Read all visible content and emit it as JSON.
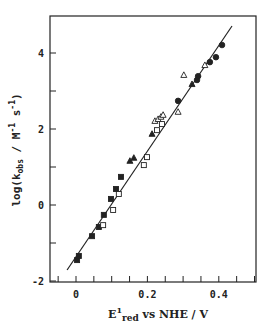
{
  "chart_data": {
    "type": "scatter",
    "title": "",
    "xlabel": "E1red vs NHE / V",
    "xlabel_parts": {
      "main": "E",
      "sup": "1",
      "sub": "red",
      "rest": " vs NHE / V"
    },
    "ylabel": "log(kobs / M-1 s-1)",
    "ylabel_parts": {
      "pre": "log(k",
      "sub": "obs",
      "mid": " / M",
      "sup1": "-1",
      "mid2": " s",
      "sup2": "-1",
      "post": ")"
    },
    "xlim": [
      -0.07,
      0.5
    ],
    "ylim": [
      -2,
      5
    ],
    "x_ticks": [
      0,
      0.2,
      0.4
    ],
    "x_tick_labels": [
      "0",
      "0.2",
      "0.4"
    ],
    "x_minor_step": 0.05,
    "y_ticks": [
      -2,
      0,
      2,
      4
    ],
    "y_tick_labels": [
      "-2",
      "0",
      "2",
      "4"
    ],
    "y_minor_step": 1,
    "grid": false,
    "legend": null,
    "series": [
      {
        "name": "filled squares",
        "marker": "square-filled",
        "points": [
          [
            0.003,
            -1.45
          ],
          [
            0.008,
            -1.34
          ],
          [
            0.045,
            -0.82
          ],
          [
            0.064,
            -0.58
          ],
          [
            0.078,
            -0.26
          ],
          [
            0.098,
            0.16
          ],
          [
            0.112,
            0.42
          ],
          [
            0.126,
            0.74
          ]
        ]
      },
      {
        "name": "open squares",
        "marker": "square-open",
        "points": [
          [
            0.076,
            -0.53
          ],
          [
            0.104,
            -0.13
          ],
          [
            0.12,
            0.29
          ],
          [
            0.19,
            1.05
          ],
          [
            0.199,
            1.26
          ],
          [
            0.227,
            1.97
          ],
          [
            0.241,
            2.13
          ]
        ]
      },
      {
        "name": "filled triangles",
        "marker": "triangle-filled",
        "points": [
          [
            0.151,
            1.16
          ],
          [
            0.162,
            1.24
          ],
          [
            0.213,
            1.87
          ],
          [
            0.325,
            3.18
          ]
        ]
      },
      {
        "name": "open triangles",
        "marker": "triangle-open",
        "points": [
          [
            0.221,
            2.21
          ],
          [
            0.23,
            2.26
          ],
          [
            0.238,
            2.32
          ],
          [
            0.244,
            2.37
          ],
          [
            0.286,
            2.45
          ],
          [
            0.302,
            3.42
          ],
          [
            0.361,
            3.68
          ]
        ]
      },
      {
        "name": "filled circles",
        "marker": "circle-filled",
        "points": [
          [
            0.286,
            2.74
          ],
          [
            0.339,
            3.29
          ],
          [
            0.342,
            3.39
          ],
          [
            0.375,
            3.76
          ],
          [
            0.392,
            3.89
          ],
          [
            0.409,
            4.21
          ]
        ]
      }
    ],
    "fit_line": {
      "x": [
        -0.025,
        0.437
      ],
      "y": [
        -1.71,
        4.71
      ]
    }
  },
  "colors": {
    "ink": "#222222",
    "background": "#ffffff"
  }
}
